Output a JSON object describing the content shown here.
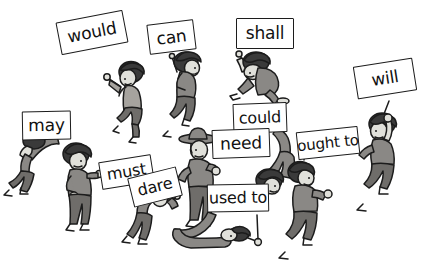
{
  "illustration": {
    "title": "Modal verbs held on placards by cartoon figures",
    "background_color": "#ffffff",
    "line_color": "#1c1c1c",
    "palette": {
      "hair_dark": "#3a3a3a",
      "skin_light": "#e0ddd6",
      "shirt_mid_gray": "#a8a5a0",
      "shirt_dark_gray": "#8a8885",
      "pants_dark": "#6e6c69",
      "outline": "#1c1c1c",
      "sign_fill": "#ffffff",
      "sign_text": "#111111"
    }
  },
  "signs": [
    {
      "id": "would",
      "label": "would",
      "x": 58,
      "y": 16,
      "w": 68,
      "h": 33,
      "rotate": -11,
      "font_size": 17
    },
    {
      "id": "can",
      "label": "can",
      "x": 148,
      "y": 22,
      "w": 47,
      "h": 30,
      "rotate": -7,
      "font_size": 17
    },
    {
      "id": "shall",
      "label": "shall",
      "x": 236,
      "y": 18,
      "w": 58,
      "h": 31,
      "rotate": 0,
      "font_size": 17
    },
    {
      "id": "will",
      "label": "will",
      "x": 355,
      "y": 62,
      "w": 60,
      "h": 33,
      "rotate": -9,
      "font_size": 17
    },
    {
      "id": "may",
      "label": "may",
      "x": 22,
      "y": 111,
      "w": 49,
      "h": 29,
      "rotate": -1,
      "font_size": 17
    },
    {
      "id": "could",
      "label": "could",
      "x": 233,
      "y": 103,
      "w": 54,
      "h": 30,
      "rotate": -2,
      "font_size": 16
    },
    {
      "id": "need",
      "label": "need",
      "x": 212,
      "y": 129,
      "w": 58,
      "h": 29,
      "rotate": -2,
      "font_size": 17
    },
    {
      "id": "ought-to",
      "label": "ought to",
      "x": 297,
      "y": 129,
      "w": 62,
      "h": 28,
      "rotate": -6,
      "font_size": 15
    },
    {
      "id": "must",
      "label": "must",
      "x": 100,
      "y": 158,
      "w": 53,
      "h": 28,
      "rotate": -9,
      "font_size": 16
    },
    {
      "id": "dare",
      "label": "dare",
      "x": 130,
      "y": 172,
      "w": 50,
      "h": 30,
      "rotate": -14,
      "font_size": 16
    },
    {
      "id": "used-to",
      "label": "used to",
      "x": 207,
      "y": 184,
      "w": 62,
      "h": 28,
      "rotate": -1,
      "font_size": 16
    }
  ],
  "figures": [
    {
      "id": "would-holder",
      "pose": "walking-arm-raised"
    },
    {
      "id": "can-holder",
      "pose": "walking-sign-on-shoulder"
    },
    {
      "id": "shall-holder",
      "pose": "crouching-on-all-fours"
    },
    {
      "id": "will-holder",
      "pose": "standing-arm-raised-hand-on-hip"
    },
    {
      "id": "may-holder",
      "pose": "bent-over-forward"
    },
    {
      "id": "must-holder",
      "pose": "standing-arm-extended"
    },
    {
      "id": "dare-holder",
      "pose": "bent-over-head-down"
    },
    {
      "id": "need-holder",
      "pose": "standing-with-hat"
    },
    {
      "id": "could-holder",
      "pose": "upside-down-handstand"
    },
    {
      "id": "ought-to-holder",
      "pose": "walking-arm-up"
    },
    {
      "id": "used-to-holder",
      "pose": "lying-on-back"
    }
  ]
}
